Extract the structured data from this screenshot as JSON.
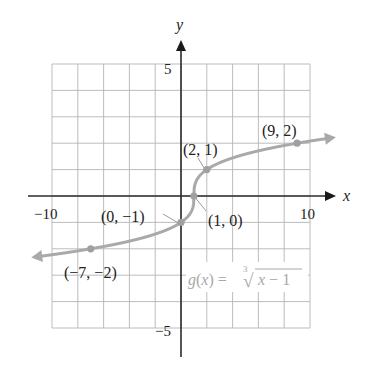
{
  "chart_data": {
    "type": "line",
    "title": "",
    "function_label": "g(x) = ∛x − 1",
    "function_label_parts": {
      "lhs": "g(x) = ",
      "index": "3",
      "radical": "√",
      "radicand": "x − 1"
    },
    "xlabel": "x",
    "ylabel": "y",
    "xlim": [
      -10,
      10
    ],
    "ylim": [
      -5,
      5
    ],
    "grid": true,
    "grid_step": {
      "x": 2,
      "y": 1
    },
    "x_tick_labels": [
      {
        "value": -10,
        "label": "−10"
      },
      {
        "value": 10,
        "label": "10"
      }
    ],
    "y_tick_labels": [
      {
        "value": 5,
        "label": "5"
      },
      {
        "value": -5,
        "label": "−5"
      }
    ],
    "series": [
      {
        "name": "g(x) = cbrt(x - 1)",
        "color": "#a9a9a9",
        "arrows_both_ends": true,
        "points": [
          {
            "x": -7,
            "y": -2,
            "label": "(−7, −2)"
          },
          {
            "x": 0,
            "y": -1,
            "label": "(0, −1)"
          },
          {
            "x": 1,
            "y": 0,
            "label": "(1, 0)"
          },
          {
            "x": 2,
            "y": 1,
            "label": "(2, 1)"
          },
          {
            "x": 9,
            "y": 2,
            "label": "(9, 2)"
          }
        ]
      }
    ]
  },
  "colors": {
    "axis": "#2b2b2b",
    "grid": "#b5b5b5",
    "curve": "#a9a9a9",
    "function_label": "#a8a8a8"
  }
}
